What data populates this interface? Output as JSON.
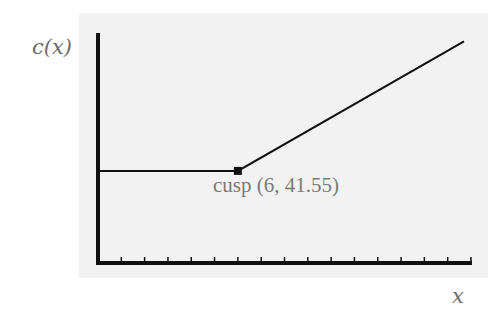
{
  "chart_data": {
    "type": "line",
    "title": "",
    "xlabel": "x",
    "ylabel": "c(x)",
    "xlim": [
      0,
      16
    ],
    "ylim": [
      0,
      106
    ],
    "x_ticks": [
      1,
      2,
      3,
      4,
      5,
      6,
      7,
      8,
      9,
      10,
      11,
      12,
      13,
      14,
      15,
      16
    ],
    "x_tick_labels": [],
    "y_ticks": [],
    "grid": false,
    "legend": null,
    "series": [
      {
        "name": "c(x)",
        "x": [
          0,
          6,
          15.7
        ],
        "y": [
          41.55,
          41.55,
          100
        ]
      }
    ],
    "annotations": [
      {
        "text": "cusp (6, 41.55)",
        "x": 6,
        "y": 41.55,
        "marker": "square"
      }
    ]
  },
  "labels": {
    "y_axis": "c(x)",
    "x_axis": "x",
    "cusp": "cusp (6, 41.55)"
  },
  "colors": {
    "plot_background": "#f2f2f2",
    "line": "#111111",
    "label_text": "#6b6b6b"
  }
}
